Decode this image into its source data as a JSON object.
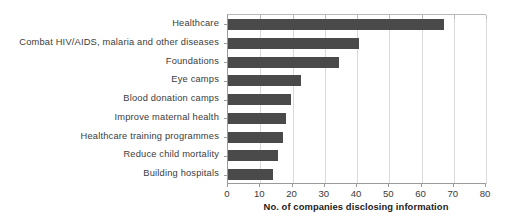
{
  "chart_data": {
    "type": "bar",
    "orientation": "horizontal",
    "title": "",
    "xlabel": "No. of companies disclosing information",
    "ylabel": "",
    "xlim": [
      0,
      80
    ],
    "xticks": [
      0,
      10,
      20,
      30,
      40,
      50,
      60,
      70,
      80
    ],
    "grid": "vertical",
    "legend": "none",
    "bar_color": "#4a4a4a",
    "categories": [
      "Healthcare",
      "Combat HIV/AIDS, malaria and other diseases",
      "Foundations",
      "Eye camps",
      "Blood donation camps",
      "Improve maternal health",
      "Healthcare training programmes",
      "Reduce child mortality",
      "Building hospitals"
    ],
    "values": [
      67,
      40.5,
      34.5,
      22.5,
      19.5,
      18,
      17,
      15.5,
      13.8
    ]
  }
}
